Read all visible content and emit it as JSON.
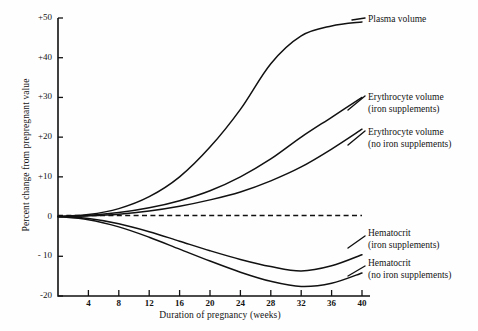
{
  "chart_data": {
    "type": "line",
    "title": "",
    "xlabel": "Duration of pregnancy (weeks)",
    "ylabel": "Percent change from prepregnant value",
    "xlim": [
      0,
      41
    ],
    "ylim": [
      -20,
      50
    ],
    "xticks": [
      "4",
      "8",
      "12",
      "16",
      "20",
      "24",
      "28",
      "32",
      "36",
      "40"
    ],
    "xtick_values": [
      4,
      8,
      12,
      16,
      20,
      24,
      28,
      32,
      36,
      40
    ],
    "yticks": [
      "+50",
      "+40",
      "+30",
      "+20",
      "+10",
      "0",
      "- 10",
      "-20"
    ],
    "ytick_values": [
      50,
      40,
      30,
      20,
      10,
      0,
      -10,
      -20
    ],
    "grid": false,
    "legend_position": "right-inline-labels",
    "reference_line": {
      "value": 0,
      "style": "dashed",
      "label": ""
    },
    "x": [
      0,
      4,
      8,
      12,
      16,
      20,
      24,
      28,
      32,
      36,
      40
    ],
    "series": [
      {
        "name": "Plasma volume",
        "label_line1": "Plasma volume",
        "label_line2": "",
        "values": [
          0,
          0.5,
          2,
          5,
          10,
          17.5,
          27,
          38.5,
          45.5,
          48,
          49
        ]
      },
      {
        "name": "Erythrocyte volume (iron supplements)",
        "label_line1": "Erythrocyte volume",
        "label_line2": "(iron supplements)",
        "values": [
          0,
          0.3,
          1,
          2.2,
          4,
          6.5,
          10,
          14.5,
          20,
          25,
          30
        ]
      },
      {
        "name": "Erythrocyte volume (no iron supplements)",
        "label_line1": "Erythrocyte volume",
        "label_line2": "(no iron supplements)",
        "values": [
          0,
          0.2,
          0.6,
          1.4,
          2.6,
          4.2,
          6.2,
          9,
          12.5,
          17,
          22
        ]
      },
      {
        "name": "Hematocrit (iron supplements)",
        "label_line1": "Hematocrit",
        "label_line2": "(iron supplements)",
        "values": [
          0,
          -0.5,
          -1.8,
          -3.8,
          -6.2,
          -8.6,
          -10.8,
          -12.6,
          -13.7,
          -12.4,
          -9.6
        ]
      },
      {
        "name": "Hematocrit (no iron supplements)",
        "label_line1": "Hematocrit",
        "label_line2": "(no iron supplements)",
        "values": [
          0,
          -0.8,
          -2.6,
          -5.2,
          -8.2,
          -11.2,
          -14.0,
          -16.3,
          -17.6,
          -16.8,
          -14.2
        ]
      }
    ]
  },
  "colors": {
    "line": "#111111",
    "axis": "#111111",
    "background": "#fefefe",
    "text": "#141414"
  }
}
